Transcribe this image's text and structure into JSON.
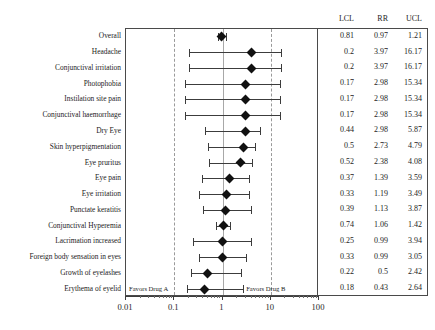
{
  "chart_data": {
    "type": "table",
    "plot_kind": "forest-plot",
    "title": "",
    "xlabel": "",
    "ylabel": "",
    "xscale": "log",
    "xlim": [
      0.01,
      100
    ],
    "xticks": [
      0.01,
      0.1,
      1,
      10,
      100
    ],
    "xticklabels": [
      "0.01",
      "0.1",
      "1",
      "10",
      "100"
    ],
    "grid": false,
    "reference_line": 1,
    "dashed_reference_lines": [
      0.1,
      10
    ],
    "legend": "",
    "annotations": {
      "left": "Favors Drug A",
      "right": "Favors Drug B"
    },
    "columns": [
      "LCL",
      "RR",
      "UCL"
    ],
    "categories": [
      "Overall",
      "Headache",
      "Conjunctival irritation",
      "Photophobia",
      "Instilation site pain",
      "Conjunctival haemorrhage",
      "Dry Eye",
      "Skin hyperpigmentation",
      "Eye pruritus",
      "Eye pain",
      "Eye irritation",
      "Punctate keratitis",
      "Conjunctival Hyperemia",
      "Lacrimation increased",
      "Foreign body sensation in eyes",
      "Growth of eyelashes",
      "Erythema of eyelid"
    ],
    "rows": [
      {
        "label": "Overall",
        "lcl": 0.81,
        "rr": 0.97,
        "ucl": 1.21,
        "lcl_text": "0.81",
        "rr_text": "0.97",
        "ucl_text": "1.21"
      },
      {
        "label": "Headache",
        "lcl": 0.2,
        "rr": 3.97,
        "ucl": 16.17,
        "lcl_text": "0.2",
        "rr_text": "3.97",
        "ucl_text": "16.17"
      },
      {
        "label": "Conjunctival irritation",
        "lcl": 0.2,
        "rr": 3.97,
        "ucl": 16.17,
        "lcl_text": "0.2",
        "rr_text": "3.97",
        "ucl_text": "16.17"
      },
      {
        "label": "Photophobia",
        "lcl": 0.17,
        "rr": 2.98,
        "ucl": 15.34,
        "lcl_text": "0.17",
        "rr_text": "2.98",
        "ucl_text": "15.34"
      },
      {
        "label": "Instilation site pain",
        "lcl": 0.17,
        "rr": 2.98,
        "ucl": 15.34,
        "lcl_text": "0.17",
        "rr_text": "2.98",
        "ucl_text": "15.34"
      },
      {
        "label": "Conjunctival haemorrhage",
        "lcl": 0.17,
        "rr": 2.98,
        "ucl": 15.34,
        "lcl_text": "0.17",
        "rr_text": "2.98",
        "ucl_text": "15.34"
      },
      {
        "label": "Dry Eye",
        "lcl": 0.44,
        "rr": 2.98,
        "ucl": 5.87,
        "lcl_text": "0.44",
        "rr_text": "2.98",
        "ucl_text": "5.87"
      },
      {
        "label": "Skin hyperpigmentation",
        "lcl": 0.5,
        "rr": 2.73,
        "ucl": 4.79,
        "lcl_text": "0.5",
        "rr_text": "2.73",
        "ucl_text": "4.79"
      },
      {
        "label": "Eye pruritus",
        "lcl": 0.52,
        "rr": 2.38,
        "ucl": 4.08,
        "lcl_text": "0.52",
        "rr_text": "2.38",
        "ucl_text": "4.08"
      },
      {
        "label": "Eye pain",
        "lcl": 0.37,
        "rr": 1.39,
        "ucl": 3.59,
        "lcl_text": "0.37",
        "rr_text": "1.39",
        "ucl_text": "3.59"
      },
      {
        "label": "Eye irritation",
        "lcl": 0.33,
        "rr": 1.19,
        "ucl": 3.49,
        "lcl_text": "0.33",
        "rr_text": "1.19",
        "ucl_text": "3.49"
      },
      {
        "label": "Punctate keratitis",
        "lcl": 0.39,
        "rr": 1.13,
        "ucl": 3.87,
        "lcl_text": "0.39",
        "rr_text": "1.13",
        "ucl_text": "3.87"
      },
      {
        "label": "Conjunctival Hyperemia",
        "lcl": 0.74,
        "rr": 1.06,
        "ucl": 1.42,
        "lcl_text": "0.74",
        "rr_text": "1.06",
        "ucl_text": "1.42"
      },
      {
        "label": "Lacrimation increased",
        "lcl": 0.25,
        "rr": 0.99,
        "ucl": 3.94,
        "lcl_text": "0.25",
        "rr_text": "0.99",
        "ucl_text": "3.94"
      },
      {
        "label": "Foreign body sensation in eyes",
        "lcl": 0.33,
        "rr": 0.99,
        "ucl": 3.05,
        "lcl_text": "0.33",
        "rr_text": "0.99",
        "ucl_text": "3.05"
      },
      {
        "label": "Growth of eyelashes",
        "lcl": 0.22,
        "rr": 0.5,
        "ucl": 2.42,
        "lcl_text": "0.22",
        "rr_text": "0.5",
        "ucl_text": "2.42"
      },
      {
        "label": "Erythema of eyelid",
        "lcl": 0.18,
        "rr": 0.43,
        "ucl": 2.64,
        "lcl_text": "0.18",
        "rr_text": "0.43",
        "ucl_text": "2.64"
      }
    ]
  },
  "colors": {
    "marker": "#111111",
    "whisker": "#3c3c3c",
    "frame": "#4a4a4a",
    "reference_solid": "#a8a8a8",
    "reference_dashed": "#9a9a9a",
    "text": "#1d1d1d",
    "background": "#ffffff"
  }
}
